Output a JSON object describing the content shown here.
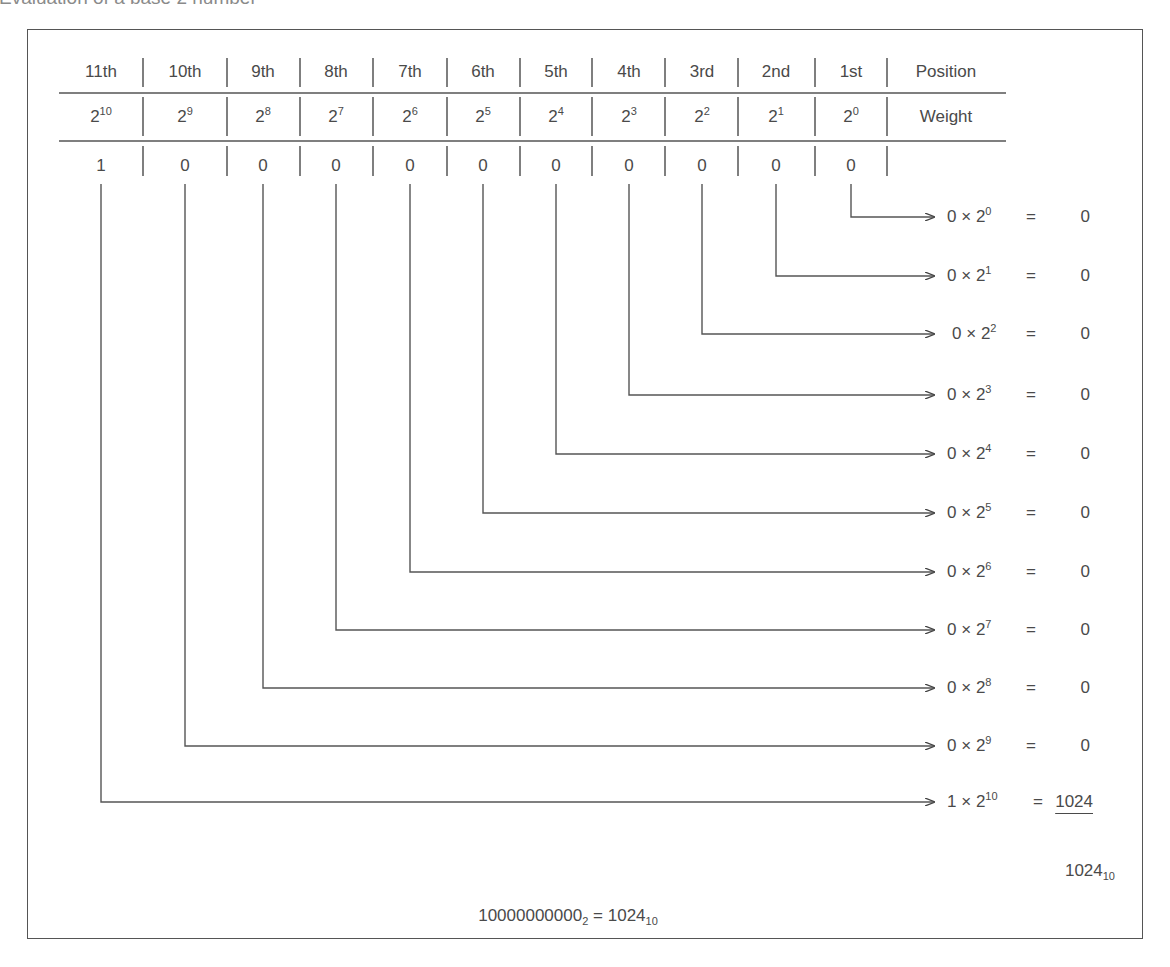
{
  "title": "Evaluation of a base 2 number",
  "table": {
    "row_labels": {
      "position": "Position",
      "weight": "Weight"
    },
    "columns": [
      {
        "position": "11th",
        "base": "2",
        "exp": "10",
        "bit": "1"
      },
      {
        "position": "10th",
        "base": "2",
        "exp": "9",
        "bit": "0"
      },
      {
        "position": "9th",
        "base": "2",
        "exp": "8",
        "bit": "0"
      },
      {
        "position": "8th",
        "base": "2",
        "exp": "7",
        "bit": "0"
      },
      {
        "position": "7th",
        "base": "2",
        "exp": "6",
        "bit": "0"
      },
      {
        "position": "6th",
        "base": "2",
        "exp": "5",
        "bit": "0"
      },
      {
        "position": "5th",
        "base": "2",
        "exp": "4",
        "bit": "0"
      },
      {
        "position": "4th",
        "base": "2",
        "exp": "3",
        "bit": "0"
      },
      {
        "position": "3rd",
        "base": "2",
        "exp": "2",
        "bit": "0"
      },
      {
        "position": "2nd",
        "base": "2",
        "exp": "1",
        "bit": "0"
      },
      {
        "position": "1st",
        "base": "2",
        "exp": "0",
        "bit": "0"
      }
    ]
  },
  "products": [
    {
      "bit": "0",
      "times": "×",
      "base": "2",
      "exp": "0",
      "equals": "=",
      "result": "0"
    },
    {
      "bit": "0",
      "times": "×",
      "base": "2",
      "exp": "1",
      "equals": "=",
      "result": "0"
    },
    {
      "bit": "0",
      "times": "×",
      "base": "2",
      "exp": "2",
      "equals": "=",
      "result": "0"
    },
    {
      "bit": "0",
      "times": "×",
      "base": "2",
      "exp": "3",
      "equals": "=",
      "result": "0"
    },
    {
      "bit": "0",
      "times": "×",
      "base": "2",
      "exp": "4",
      "equals": "=",
      "result": "0"
    },
    {
      "bit": "0",
      "times": "×",
      "base": "2",
      "exp": "5",
      "equals": "=",
      "result": "0"
    },
    {
      "bit": "0",
      "times": "×",
      "base": "2",
      "exp": "6",
      "equals": "=",
      "result": "0"
    },
    {
      "bit": "0",
      "times": "×",
      "base": "2",
      "exp": "7",
      "equals": "=",
      "result": "0"
    },
    {
      "bit": "0",
      "times": "×",
      "base": "2",
      "exp": "8",
      "equals": "=",
      "result": "0"
    },
    {
      "bit": "0",
      "times": "×",
      "base": "2",
      "exp": "9",
      "equals": "=",
      "result": "0"
    },
    {
      "bit": "1",
      "times": "×",
      "base": "2",
      "exp": "10",
      "equals": "=",
      "result": "1024"
    }
  ],
  "sum": {
    "value": "1024",
    "subscript": "10"
  },
  "conclusion": {
    "binary": "10000000000",
    "binary_base": "2",
    "equals": "=",
    "decimal": "1024",
    "decimal_base": "10"
  },
  "colors": {
    "text": "#4a4a4a",
    "line": "#555555"
  }
}
